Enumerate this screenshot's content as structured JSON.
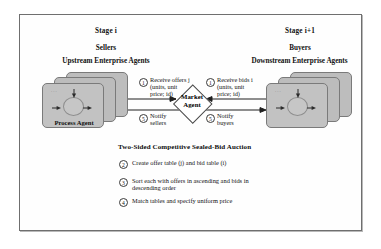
{
  "figure": {
    "caption_title": "Two-Sided Competitive Sealed-Bid Auction"
  },
  "stages": {
    "left": {
      "stage_label": "Stage i",
      "role_label": "Sellers",
      "agents_label": "Upstream Enterprise Agents",
      "card_label": "Process Agent",
      "dots": "..."
    },
    "right": {
      "stage_label": "Stage i+1",
      "role_label": "Buyers",
      "agents_label": "Downstream Enterprise Agents",
      "card_label": "",
      "dots": "..."
    }
  },
  "market_agent": {
    "line1": "Market",
    "line2": "Agent"
  },
  "flows": [
    {
      "id": "receive-offers",
      "number": "1",
      "line1": "Receive offers j",
      "line2": "(units, unit",
      "line3": "price; id)"
    },
    {
      "id": "receive-bids",
      "number": "1",
      "line1": "Receive bids i",
      "line2": "(units, unit",
      "line3": "price; id)"
    },
    {
      "id": "notify-sellers",
      "number": "5",
      "line1": "Notify",
      "line2": "sellers"
    },
    {
      "id": "notify-buyers",
      "number": "5",
      "line1": "Notify",
      "line2": "buyers"
    }
  ],
  "steps": [
    {
      "number": "2",
      "line1": "Create offer table (j) and bid table (i)",
      "line2": ""
    },
    {
      "number": "3",
      "line1": "Sort each with offers in ascending and bids in",
      "line2": "descending order"
    },
    {
      "number": "4",
      "line1": "Match tables and specify uniform price",
      "line2": ""
    }
  ],
  "colors": {
    "card_fill": "#b9b9b9",
    "card_stroke": "#7a7a7a",
    "frame_stroke": "#6f6f6f",
    "text": "#111111"
  }
}
